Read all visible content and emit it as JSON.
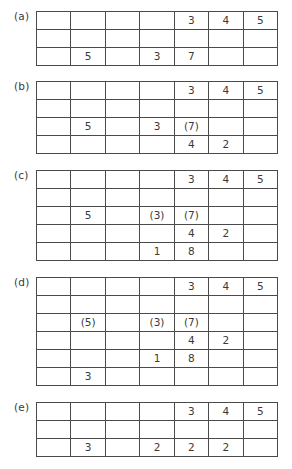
{
  "panels": [
    {
      "label": "(a)",
      "rows": [
        [
          "",
          "",
          "",
          "",
          "3",
          "4",
          "5"
        ],
        [
          "",
          "",
          "",
          "",
          "",
          "",
          ""
        ],
        [
          "",
          "5",
          "",
          "3",
          "7",
          "",
          ""
        ]
      ]
    },
    {
      "label": "(b)",
      "rows": [
        [
          "",
          "",
          "",
          "",
          "3",
          "4",
          "5"
        ],
        [
          "",
          "",
          "",
          "",
          "",
          "",
          ""
        ],
        [
          "",
          "5",
          "",
          "3",
          "(7)",
          "",
          ""
        ],
        [
          "",
          "",
          "",
          "",
          "4",
          "2",
          ""
        ]
      ]
    },
    {
      "label": "(c)",
      "rows": [
        [
          "",
          "",
          "",
          "",
          "3",
          "4",
          "5"
        ],
        [
          "",
          "",
          "",
          "",
          "",
          "",
          ""
        ],
        [
          "",
          "5",
          "",
          "(3)",
          "(7)",
          "",
          ""
        ],
        [
          "",
          "",
          "",
          "",
          "4",
          "2",
          ""
        ],
        [
          "",
          "",
          "",
          "1",
          "8",
          "",
          ""
        ]
      ]
    },
    {
      "label": "(d)",
      "rows": [
        [
          "",
          "",
          "",
          "",
          "3",
          "4",
          "5"
        ],
        [
          "",
          "",
          "",
          "",
          "",
          "",
          ""
        ],
        [
          "",
          "(5)",
          "",
          "(3)",
          "(7)",
          "",
          ""
        ],
        [
          "",
          "",
          "",
          "",
          "4",
          "2",
          ""
        ],
        [
          "",
          "",
          "",
          "1",
          "8",
          "",
          ""
        ],
        [
          "",
          "3",
          "",
          "",
          "",
          "",
          ""
        ]
      ]
    },
    {
      "label": "(e)",
      "rows": [
        [
          "",
          "",
          "",
          "",
          "3",
          "4",
          "5"
        ],
        [
          "",
          "",
          "",
          "",
          "",
          "",
          ""
        ],
        [
          "",
          "3",
          "",
          "2",
          "2",
          "2",
          ""
        ]
      ]
    }
  ]
}
